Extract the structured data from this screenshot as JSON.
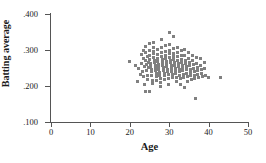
{
  "chart_data": {
    "type": "scatter",
    "title": "",
    "xlabel": "Age",
    "ylabel": "Batting average",
    "xlim": [
      0,
      50
    ],
    "ylim": [
      0.1,
      0.4
    ],
    "xticks": [
      0,
      10,
      20,
      30,
      40,
      50
    ],
    "xtick_labels": [
      "0",
      "10",
      "20",
      "30",
      "40",
      "50"
    ],
    "yticks": [
      0.1,
      0.2,
      0.3,
      0.4
    ],
    "ytick_labels": [
      ".100",
      ".200",
      ".300",
      ".400"
    ],
    "grid": false,
    "legend": null,
    "marker_color": "#808080",
    "marker_shape": "square",
    "axis_color": "#555555",
    "points": [
      [
        20.0,
        0.268
      ],
      [
        21.4,
        0.258
      ],
      [
        22.0,
        0.212
      ],
      [
        22.3,
        0.248
      ],
      [
        22.6,
        0.232
      ],
      [
        23.0,
        0.288
      ],
      [
        23.0,
        0.262
      ],
      [
        23.2,
        0.24
      ],
      [
        23.4,
        0.3
      ],
      [
        23.5,
        0.226
      ],
      [
        23.6,
        0.276
      ],
      [
        23.7,
        0.254
      ],
      [
        23.8,
        0.205
      ],
      [
        23.9,
        0.186
      ],
      [
        24.0,
        0.31
      ],
      [
        24.0,
        0.292
      ],
      [
        24.1,
        0.272
      ],
      [
        24.2,
        0.259
      ],
      [
        24.3,
        0.244
      ],
      [
        24.4,
        0.23
      ],
      [
        24.5,
        0.218
      ],
      [
        24.6,
        0.282
      ],
      [
        24.7,
        0.265
      ],
      [
        24.8,
        0.251
      ],
      [
        24.9,
        0.186
      ],
      [
        25.0,
        0.318
      ],
      [
        25.0,
        0.298
      ],
      [
        25.0,
        0.285
      ],
      [
        25.1,
        0.274
      ],
      [
        25.2,
        0.263
      ],
      [
        25.3,
        0.255
      ],
      [
        25.4,
        0.247
      ],
      [
        25.5,
        0.239
      ],
      [
        25.6,
        0.228
      ],
      [
        25.7,
        0.216
      ],
      [
        25.8,
        0.208
      ],
      [
        25.9,
        0.296
      ],
      [
        26.0,
        0.322
      ],
      [
        26.0,
        0.306
      ],
      [
        26.0,
        0.29
      ],
      [
        26.1,
        0.28
      ],
      [
        26.2,
        0.271
      ],
      [
        26.3,
        0.264
      ],
      [
        26.4,
        0.257
      ],
      [
        26.5,
        0.25
      ],
      [
        26.6,
        0.243
      ],
      [
        26.7,
        0.236
      ],
      [
        26.8,
        0.226
      ],
      [
        26.9,
        0.214
      ],
      [
        27.0,
        0.302
      ],
      [
        27.0,
        0.288
      ],
      [
        27.0,
        0.276
      ],
      [
        27.1,
        0.268
      ],
      [
        27.2,
        0.26
      ],
      [
        27.3,
        0.253
      ],
      [
        27.4,
        0.246
      ],
      [
        27.5,
        0.238
      ],
      [
        27.6,
        0.23
      ],
      [
        27.7,
        0.222
      ],
      [
        27.8,
        0.21
      ],
      [
        27.9,
        0.199
      ],
      [
        28.0,
        0.33
      ],
      [
        28.0,
        0.308
      ],
      [
        28.0,
        0.294
      ],
      [
        28.1,
        0.283
      ],
      [
        28.2,
        0.274
      ],
      [
        28.3,
        0.266
      ],
      [
        28.4,
        0.258
      ],
      [
        28.5,
        0.251
      ],
      [
        28.6,
        0.244
      ],
      [
        28.7,
        0.236
      ],
      [
        28.8,
        0.228
      ],
      [
        28.9,
        0.218
      ],
      [
        29.0,
        0.312
      ],
      [
        29.0,
        0.297
      ],
      [
        29.0,
        0.286
      ],
      [
        29.1,
        0.277
      ],
      [
        29.2,
        0.269
      ],
      [
        29.3,
        0.261
      ],
      [
        29.4,
        0.254
      ],
      [
        29.5,
        0.247
      ],
      [
        29.6,
        0.24
      ],
      [
        29.7,
        0.232
      ],
      [
        29.8,
        0.222
      ],
      [
        29.9,
        0.204
      ],
      [
        30.0,
        0.35
      ],
      [
        30.0,
        0.316
      ],
      [
        30.0,
        0.3
      ],
      [
        30.1,
        0.289
      ],
      [
        30.2,
        0.28
      ],
      [
        30.3,
        0.272
      ],
      [
        30.4,
        0.264
      ],
      [
        30.5,
        0.256
      ],
      [
        30.6,
        0.249
      ],
      [
        30.7,
        0.241
      ],
      [
        30.8,
        0.233
      ],
      [
        30.9,
        0.223
      ],
      [
        31.0,
        0.338
      ],
      [
        31.0,
        0.304
      ],
      [
        31.0,
        0.291
      ],
      [
        31.1,
        0.282
      ],
      [
        31.2,
        0.273
      ],
      [
        31.3,
        0.265
      ],
      [
        31.4,
        0.258
      ],
      [
        31.5,
        0.25
      ],
      [
        31.6,
        0.242
      ],
      [
        31.7,
        0.234
      ],
      [
        31.8,
        0.224
      ],
      [
        31.9,
        0.212
      ],
      [
        32.0,
        0.308
      ],
      [
        32.0,
        0.293
      ],
      [
        32.1,
        0.281
      ],
      [
        32.2,
        0.271
      ],
      [
        32.3,
        0.263
      ],
      [
        32.4,
        0.255
      ],
      [
        32.5,
        0.247
      ],
      [
        32.6,
        0.239
      ],
      [
        32.7,
        0.23
      ],
      [
        32.8,
        0.22
      ],
      [
        32.9,
        0.203
      ],
      [
        33.0,
        0.299
      ],
      [
        33.0,
        0.286
      ],
      [
        33.1,
        0.275
      ],
      [
        33.2,
        0.266
      ],
      [
        33.3,
        0.258
      ],
      [
        33.4,
        0.25
      ],
      [
        33.5,
        0.242
      ],
      [
        33.6,
        0.233
      ],
      [
        33.7,
        0.223
      ],
      [
        33.8,
        0.196
      ],
      [
        34.0,
        0.302
      ],
      [
        34.0,
        0.284
      ],
      [
        34.1,
        0.272
      ],
      [
        34.2,
        0.262
      ],
      [
        34.3,
        0.253
      ],
      [
        34.4,
        0.245
      ],
      [
        34.5,
        0.236
      ],
      [
        34.6,
        0.226
      ],
      [
        34.7,
        0.213
      ],
      [
        35.0,
        0.292
      ],
      [
        35.0,
        0.277
      ],
      [
        35.1,
        0.266
      ],
      [
        35.2,
        0.256
      ],
      [
        35.3,
        0.247
      ],
      [
        35.4,
        0.238
      ],
      [
        35.5,
        0.228
      ],
      [
        35.6,
        0.217
      ],
      [
        36.0,
        0.286
      ],
      [
        36.0,
        0.27
      ],
      [
        36.1,
        0.259
      ],
      [
        36.2,
        0.249
      ],
      [
        36.3,
        0.24
      ],
      [
        36.4,
        0.23
      ],
      [
        36.5,
        0.222
      ],
      [
        36.6,
        0.166
      ],
      [
        37.0,
        0.278
      ],
      [
        37.0,
        0.262
      ],
      [
        37.1,
        0.252
      ],
      [
        37.2,
        0.243
      ],
      [
        37.3,
        0.233
      ],
      [
        37.4,
        0.224
      ],
      [
        38.0,
        0.276
      ],
      [
        38.0,
        0.258
      ],
      [
        38.1,
        0.246
      ],
      [
        38.2,
        0.236
      ],
      [
        38.5,
        0.226
      ],
      [
        39.0,
        0.266
      ],
      [
        39.0,
        0.25
      ],
      [
        39.3,
        0.228
      ],
      [
        40.0,
        0.225
      ],
      [
        43.0,
        0.224
      ]
    ]
  }
}
